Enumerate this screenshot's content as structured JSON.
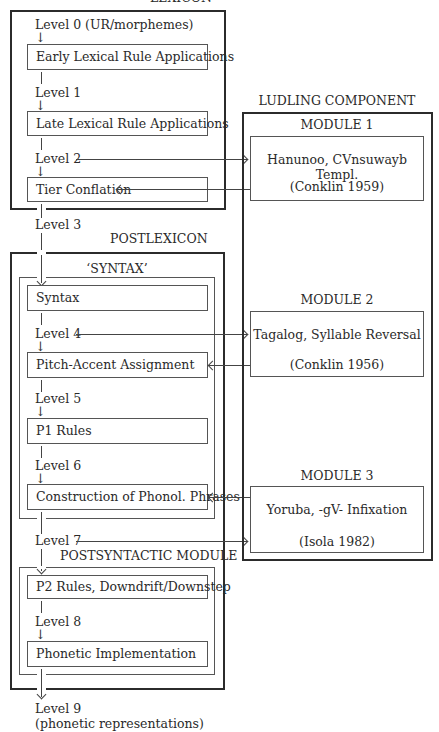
{
  "lexicon": {
    "title": "LEXICON",
    "levels": {
      "level0": "Level 0 (UR/morphemes)",
      "level1": "Level 1",
      "level2": "Level 2"
    },
    "rules": {
      "early": "Early Lexical Rule  Applications",
      "late": "Late Lexical Rule  Applications",
      "tier": "Tier Conflation"
    }
  },
  "level3": "Level 3",
  "postlexicon": {
    "title": "POSTLEXICON",
    "syntax_module": {
      "title": "‘SYNTAX’",
      "rules": {
        "syntax": "Syntax",
        "pitch": "Pitch-Accent Assignment",
        "p1": "P1 Rules",
        "construction": "Construction of Phonol. Phrases"
      },
      "levels": {
        "level4": "Level 4",
        "level5": "Level 5",
        "level6": "Level 6"
      }
    },
    "level7": "Level 7",
    "postsyntactic_module": {
      "title": "POSTSYNTACTIC MODULE",
      "rules": {
        "p2": "P2 Rules, Downdrift/Downstep",
        "phonetic": "Phonetic Implementation"
      },
      "levels": {
        "level8": "Level 8"
      }
    }
  },
  "level9": {
    "line1": "Level 9",
    "line2": "(phonetic representations)"
  },
  "ludling": {
    "title": "LUDLING COMPONENT",
    "modules": [
      {
        "title": "MODULE 1",
        "name": "Hanunoo, CVnsuwayb Templ.",
        "citation": "(Conklin 1959)"
      },
      {
        "title": "MODULE 2",
        "name": "Tagalog, Syllable Reversal",
        "citation": "(Conklin 1956)"
      },
      {
        "title": "MODULE 3",
        "name": "Yoruba, -gV- Infixation",
        "citation": "(Isola 1982)"
      }
    ]
  }
}
